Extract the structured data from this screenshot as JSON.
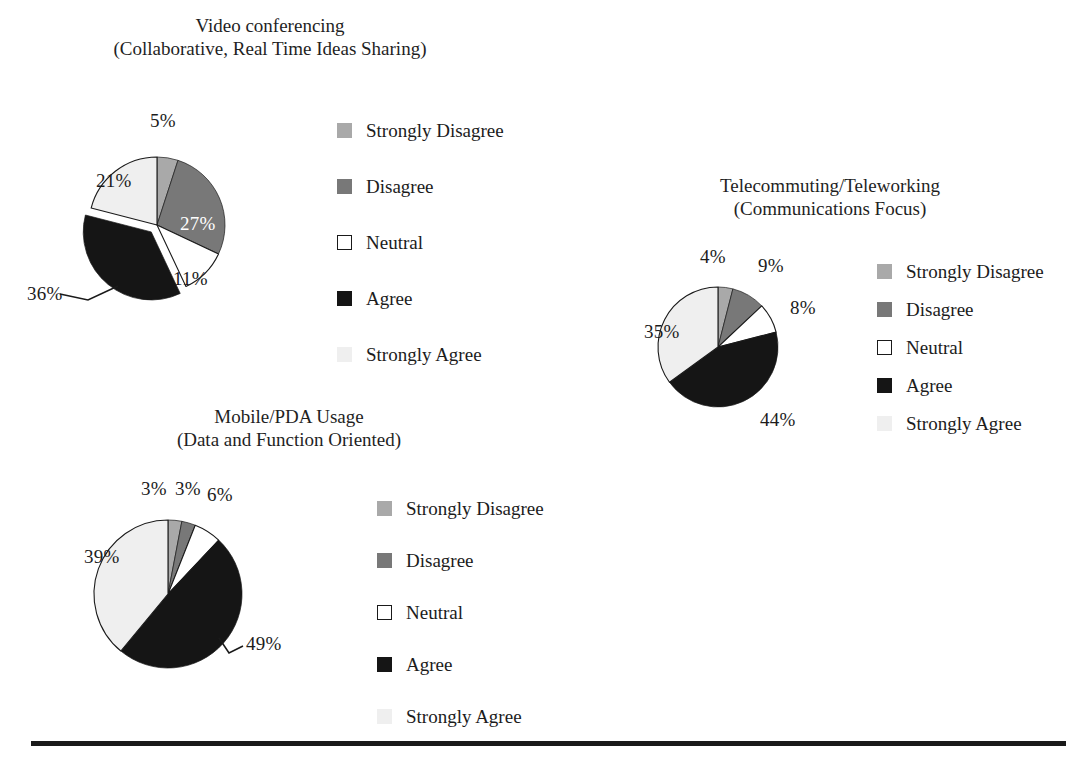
{
  "figure": {
    "background": "#ffffff",
    "rule": {
      "x": 31,
      "y": 741,
      "width": 1035,
      "height": 5,
      "color": "#1a1a1a"
    }
  },
  "palette": {
    "strongly_disagree": "#a9a9a9",
    "disagree": "#787878",
    "neutral": "#ffffff",
    "neutral_border": "#1a1a1a",
    "agree": "#151515",
    "strongly_agree": "#efefef",
    "label_text": "#1c1c1c",
    "label_text_on_dark": "#ffffff"
  },
  "legend_labels": [
    "Strongly Disagree",
    "Disagree",
    "Neutral",
    "Agree",
    "Strongly Agree"
  ],
  "charts": [
    {
      "id": "video-conferencing",
      "title_line1": "Video conferencing",
      "title_line2": "(Collaborative, Real Time Ideas Sharing)",
      "title": {
        "x": 270,
        "y": 14
      },
      "pie": {
        "cx": 157,
        "cy": 225,
        "r": 68,
        "explode_index": 3,
        "explode_offset": 9
      },
      "labels": [
        {
          "text": "5%",
          "x": 150,
          "y": 110,
          "on_dark": false
        },
        {
          "text": "27%",
          "x": 180,
          "y": 213,
          "on_dark": true
        },
        {
          "text": "11%",
          "x": 173,
          "y": 268,
          "on_dark": false
        },
        {
          "text": "36%",
          "x": 27,
          "y": 283,
          "on_dark": false
        },
        {
          "text": "21%",
          "x": 96,
          "y": 170,
          "on_dark": false
        }
      ],
      "leader": {
        "x1": 60,
        "y1": 294,
        "x2": 88,
        "y2": 300,
        "x3": 118,
        "y3": 286
      },
      "legend": {
        "x": 337,
        "y": 102,
        "row_gap": 56
      }
    },
    {
      "id": "telecommuting-teleworking",
      "title_line1": "Telecommuting/Teleworking",
      "title_line2": "(Communications Focus)",
      "title": {
        "x": 830,
        "y": 174
      },
      "pie": {
        "cx": 718,
        "cy": 347,
        "r": 60,
        "explode_index": -1,
        "explode_offset": 0
      },
      "labels": [
        {
          "text": "4%",
          "x": 700,
          "y": 246,
          "on_dark": false
        },
        {
          "text": "9%",
          "x": 758,
          "y": 255,
          "on_dark": false
        },
        {
          "text": "8%",
          "x": 790,
          "y": 297,
          "on_dark": false
        },
        {
          "text": "44%",
          "x": 760,
          "y": 409,
          "on_dark": false
        },
        {
          "text": "35%",
          "x": 644,
          "y": 321,
          "on_dark": false
        }
      ],
      "leader": null,
      "legend": {
        "x": 877,
        "y": 252,
        "row_gap": 38
      }
    },
    {
      "id": "mobile-pda-usage",
      "title_line1": "Mobile/PDA Usage",
      "title_line2": "(Data and Function Oriented)",
      "title": {
        "x": 289,
        "y": 405
      },
      "pie": {
        "cx": 168,
        "cy": 594,
        "r": 74,
        "explode_index": -1,
        "explode_offset": 0
      },
      "labels": [
        {
          "text": "3%",
          "x": 141,
          "y": 478,
          "on_dark": false
        },
        {
          "text": "3%",
          "x": 175,
          "y": 478,
          "on_dark": false
        },
        {
          "text": "6%",
          "x": 207,
          "y": 484,
          "on_dark": false
        },
        {
          "text": "49%",
          "x": 246,
          "y": 633,
          "on_dark": false
        },
        {
          "text": "39%",
          "x": 84,
          "y": 546,
          "on_dark": false
        }
      ],
      "leader": {
        "x1": 243,
        "y1": 646,
        "x2": 229,
        "y2": 653,
        "x3": 219,
        "y3": 638
      },
      "legend": {
        "x": 377,
        "y": 482,
        "row_gap": 52
      }
    }
  ],
  "chart_data": [
    {
      "type": "pie",
      "title": "Video conferencing (Collaborative, Real Time Ideas Sharing)",
      "categories": [
        "Strongly Disagree",
        "Disagree",
        "Neutral",
        "Agree",
        "Strongly Agree"
      ],
      "values": [
        5,
        27,
        11,
        36,
        21
      ],
      "unit": "%",
      "start_angle_deg": 0,
      "direction": "clockwise",
      "exploded": [
        "Agree"
      ],
      "legend_position": "right"
    },
    {
      "type": "pie",
      "title": "Telecommuting/Teleworking (Communications Focus)",
      "categories": [
        "Strongly Disagree",
        "Disagree",
        "Neutral",
        "Agree",
        "Strongly Agree"
      ],
      "values": [
        4,
        9,
        8,
        44,
        35
      ],
      "unit": "%",
      "start_angle_deg": 0,
      "direction": "clockwise",
      "exploded": [],
      "legend_position": "right"
    },
    {
      "type": "pie",
      "title": "Mobile/PDA Usage (Data and Function Oriented)",
      "categories": [
        "Strongly Disagree",
        "Disagree",
        "Neutral",
        "Agree",
        "Strongly Agree"
      ],
      "values": [
        3,
        3,
        6,
        49,
        39
      ],
      "unit": "%",
      "start_angle_deg": 0,
      "direction": "clockwise",
      "exploded": [],
      "legend_position": "right"
    }
  ]
}
